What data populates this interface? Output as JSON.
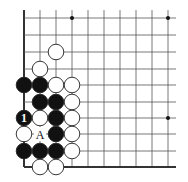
{
  "diagram": {
    "type": "go-board-fragment",
    "grid": {
      "columns_x": [
        24,
        40,
        56,
        72,
        88,
        104,
        120,
        136,
        152,
        168
      ],
      "rows_y": [
        18,
        35,
        52,
        69,
        85,
        102,
        118,
        134,
        151,
        167
      ],
      "right_extent": 176,
      "top_extent": 10,
      "edges": [
        "left",
        "bottom"
      ]
    },
    "star_points": [
      {
        "col": 3,
        "row": 0
      },
      {
        "col": 9,
        "row": 0
      },
      {
        "col": 9,
        "row": 6
      }
    ],
    "stones": [
      {
        "color": "white",
        "col": 2,
        "row": 2
      },
      {
        "color": "white",
        "col": 1,
        "row": 3
      },
      {
        "color": "black",
        "col": 0,
        "row": 4
      },
      {
        "color": "black",
        "col": 1,
        "row": 4
      },
      {
        "color": "white",
        "col": 2,
        "row": 4
      },
      {
        "color": "white",
        "col": 3,
        "row": 4
      },
      {
        "color": "black",
        "col": 1,
        "row": 5
      },
      {
        "color": "black",
        "col": 2,
        "row": 5
      },
      {
        "color": "white",
        "col": 3,
        "row": 5
      },
      {
        "color": "black",
        "col": 0,
        "row": 6,
        "label": "1"
      },
      {
        "color": "white",
        "col": 1,
        "row": 6
      },
      {
        "color": "black",
        "col": 2,
        "row": 6
      },
      {
        "color": "white",
        "col": 3,
        "row": 6
      },
      {
        "color": "white",
        "col": 0,
        "row": 7
      },
      {
        "color": "black",
        "col": 2,
        "row": 7
      },
      {
        "color": "white",
        "col": 3,
        "row": 7
      },
      {
        "color": "black",
        "col": 0,
        "row": 8
      },
      {
        "color": "black",
        "col": 1,
        "row": 8
      },
      {
        "color": "black",
        "col": 2,
        "row": 8
      },
      {
        "color": "white",
        "col": 3,
        "row": 8
      },
      {
        "color": "white",
        "col": 1,
        "row": 9
      },
      {
        "color": "white",
        "col": 2,
        "row": 9
      }
    ],
    "point_labels": [
      {
        "text": "A",
        "col": 1,
        "row": 7
      }
    ],
    "colors": {
      "line": "#555555",
      "edge": "#333333",
      "black_stone": "#111111",
      "white_stone": "#ffffff",
      "stone_outline": "#222222"
    }
  }
}
